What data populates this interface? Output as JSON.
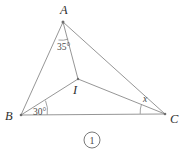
{
  "figure": {
    "caption_number": "1",
    "caption_glyph": "①",
    "stroke_color": "#8a8a8a",
    "label_color": "#2f2f2f",
    "background": "#ffffff",
    "points": {
      "A": {
        "label": "A",
        "x": 63,
        "y": 22,
        "label_x": 60,
        "label_y": 12
      },
      "B": {
        "label": "B",
        "x": 21,
        "y": 115,
        "label_x": 6,
        "label_y": 120
      },
      "C": {
        "label": "C",
        "x": 165,
        "y": 114,
        "label_x": 171,
        "label_y": 122
      },
      "I": {
        "label": "I",
        "x": 78,
        "y": 79,
        "label_x": 74,
        "label_y": 94
      }
    },
    "segments": [
      {
        "name": "AB",
        "from": "A",
        "to": "B"
      },
      {
        "name": "BC",
        "from": "B",
        "to": "C"
      },
      {
        "name": "AC",
        "from": "A",
        "to": "C"
      },
      {
        "name": "AI",
        "from": "A",
        "to": "I"
      },
      {
        "name": "BI",
        "from": "B",
        "to": "I"
      },
      {
        "name": "IC",
        "from": "I",
        "to": "C"
      }
    ],
    "angles": [
      {
        "name": "angle-at-A",
        "vertex": "A",
        "value": "35°",
        "label_x": 58,
        "label_y": 48,
        "between": [
          "AB",
          "AI"
        ]
      },
      {
        "name": "angle-at-B",
        "vertex": "B",
        "value": "30°",
        "label_x": 34,
        "label_y": 114,
        "between": [
          "BI",
          "BC"
        ]
      },
      {
        "name": "angle-at-C",
        "vertex": "C",
        "value": "x",
        "label_x": 143,
        "label_y": 101,
        "between": [
          "IC",
          "CB"
        ]
      }
    ]
  }
}
